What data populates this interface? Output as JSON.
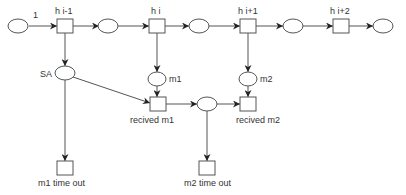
{
  "diagram": {
    "type": "petri-net",
    "places": [
      {
        "id": "p1",
        "label": "1"
      },
      {
        "id": "p2",
        "label": ""
      },
      {
        "id": "p3",
        "label": ""
      },
      {
        "id": "p4",
        "label": ""
      },
      {
        "id": "p5",
        "label": ""
      },
      {
        "id": "sa",
        "label": "SA"
      },
      {
        "id": "m1",
        "label": "m1"
      },
      {
        "id": "m2",
        "label": "m2"
      },
      {
        "id": "pm",
        "label": ""
      }
    ],
    "transitions": [
      {
        "id": "t_hi_1",
        "label": "h i-1"
      },
      {
        "id": "t_hi",
        "label": "h i"
      },
      {
        "id": "t_hi1",
        "label": "h i+1"
      },
      {
        "id": "t_hi2",
        "label": "h i+2"
      },
      {
        "id": "t_rm1",
        "label": "recived m1"
      },
      {
        "id": "t_rm2",
        "label": "recived m2"
      },
      {
        "id": "t_m1to",
        "label": "m1 time out"
      },
      {
        "id": "t_m2to",
        "label": "m2 time out"
      }
    ],
    "arcs": [
      [
        "p1",
        "t_hi_1"
      ],
      [
        "t_hi_1",
        "p2"
      ],
      [
        "p2",
        "t_hi"
      ],
      [
        "t_hi",
        "p3"
      ],
      [
        "p3",
        "t_hi1"
      ],
      [
        "t_hi1",
        "p4"
      ],
      [
        "p4",
        "t_hi2"
      ],
      [
        "t_hi2",
        "p5"
      ],
      [
        "t_hi_1",
        "sa"
      ],
      [
        "t_hi",
        "m1"
      ],
      [
        "t_hi1",
        "m2"
      ],
      [
        "sa",
        "t_rm1"
      ],
      [
        "sa",
        "t_m1to"
      ],
      [
        "m1",
        "t_rm1"
      ],
      [
        "t_rm1",
        "pm"
      ],
      [
        "pm",
        "t_rm2"
      ],
      [
        "pm",
        "t_m2to"
      ],
      [
        "m2",
        "t_rm2"
      ]
    ]
  }
}
